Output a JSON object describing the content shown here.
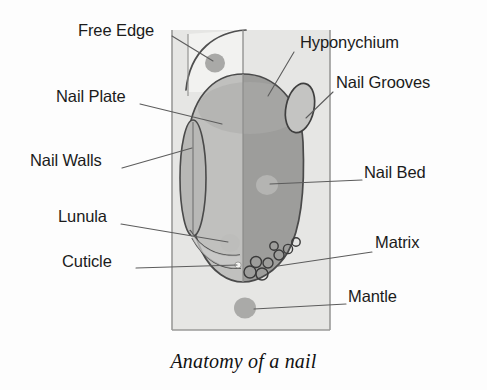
{
  "figure": {
    "caption": "Anatomy of a nail",
    "title": "Anatomy of a nail"
  },
  "colors": {
    "background": "#fdfdfd",
    "finger_fill": "#e3e3e1",
    "finger_outline": "#8e8e8e",
    "nail_left_fill": "#bdbdbb",
    "nail_right_fill": "#9a9a98",
    "nail_outline": "#4a4a4a",
    "marker_dot": "#a9a9a7",
    "lunula_fill": "#c9c9c7",
    "leader_line": "#5c5c5c",
    "label_text": "#1b1b1b",
    "caption_text": "#111111"
  },
  "labels": [
    {
      "id": "free-edge",
      "text": "Free Edge",
      "x": 78,
      "y": 30,
      "align": "left"
    },
    {
      "id": "hyponychium",
      "text": "Hyponychium",
      "x": 300,
      "y": 42,
      "align": "left"
    },
    {
      "id": "nail-grooves",
      "text": "Nail Grooves",
      "x": 336,
      "y": 82,
      "align": "left"
    },
    {
      "id": "nail-plate",
      "text": "Nail Plate",
      "x": 56,
      "y": 96,
      "align": "left"
    },
    {
      "id": "nail-walls",
      "text": "Nail Walls",
      "x": 30,
      "y": 160,
      "align": "left"
    },
    {
      "id": "nail-bed",
      "text": "Nail Bed",
      "x": 364,
      "y": 172,
      "align": "left"
    },
    {
      "id": "lunula",
      "text": "Lunula",
      "x": 58,
      "y": 216,
      "align": "left"
    },
    {
      "id": "matrix",
      "text": "Matrix",
      "x": 375,
      "y": 242,
      "align": "left"
    },
    {
      "id": "cuticle",
      "text": "Cuticle",
      "x": 62,
      "y": 261,
      "align": "left"
    },
    {
      "id": "mantle",
      "text": "Mantle",
      "x": 348,
      "y": 296,
      "align": "left"
    }
  ],
  "parts": [
    {
      "id": "free-edge",
      "name": "Free Edge"
    },
    {
      "id": "nail-plate",
      "name": "Nail Plate"
    },
    {
      "id": "nail-walls",
      "name": "Nail Walls"
    },
    {
      "id": "lunula",
      "name": "Lunula"
    },
    {
      "id": "cuticle",
      "name": "Cuticle"
    },
    {
      "id": "hyponychium",
      "name": "Hyponychium"
    },
    {
      "id": "nail-grooves",
      "name": "Nail Grooves"
    },
    {
      "id": "nail-bed",
      "name": "Nail Bed"
    },
    {
      "id": "matrix",
      "name": "Matrix"
    },
    {
      "id": "mantle",
      "name": "Mantle"
    }
  ]
}
